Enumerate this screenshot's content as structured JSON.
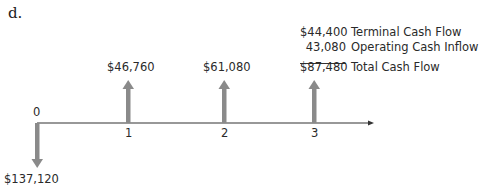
{
  "part_label": "d.",
  "timeline": {
    "periods": [
      {
        "index": "0",
        "amount": "$137,120",
        "direction": "outflow"
      },
      {
        "index": "1",
        "amount": "$46,760",
        "direction": "inflow"
      },
      {
        "index": "2",
        "amount": "$61,080",
        "direction": "inflow"
      },
      {
        "index": "3",
        "amount": "$87,480",
        "direction": "inflow"
      }
    ],
    "arrow_color": "#8a8a8a",
    "axis_color": "#333333"
  },
  "breakdown": [
    {
      "amount": "$44,400",
      "label": "Terminal Cash Flow"
    },
    {
      "amount": "43,080",
      "label": "Operating Cash Inflow"
    },
    {
      "amount": "$87,480",
      "label": "Total Cash Flow"
    }
  ]
}
